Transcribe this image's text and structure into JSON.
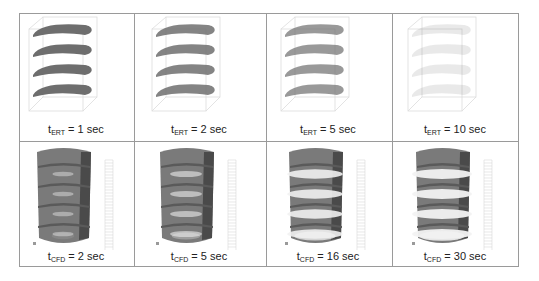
{
  "figure": {
    "rows": [
      {
        "row_id": "ert",
        "type": "ert-tomography",
        "cells": [
          {
            "var": "t",
            "subscript": "ERT",
            "value": "= 1 sec",
            "intensity": 1.0
          },
          {
            "var": "t",
            "subscript": "ERT",
            "value": "= 2 sec",
            "intensity": 0.85
          },
          {
            "var": "t",
            "subscript": "ERT",
            "value": "= 5 sec",
            "intensity": 0.7
          },
          {
            "var": "t",
            "subscript": "ERT",
            "value": "= 10 sec",
            "intensity": 0.15
          }
        ]
      },
      {
        "row_id": "cfd",
        "type": "cfd-simulation",
        "cells": [
          {
            "var": "t",
            "subscript": "CFD",
            "value": "= 2 sec",
            "white": 0.1
          },
          {
            "var": "t",
            "subscript": "CFD",
            "value": "= 5 sec",
            "white": 0.3
          },
          {
            "var": "t",
            "subscript": "CFD",
            "value": "= 16 sec",
            "white": 0.75
          },
          {
            "var": "t",
            "subscript": "CFD",
            "value": "= 30 sec",
            "white": 0.9
          }
        ]
      }
    ],
    "colors": {
      "border": "#9a9a9a",
      "ert_blob": "#6e6e6e",
      "cfd_body": "#7a7a7a",
      "cfd_dark": "#4a4a4a",
      "cfd_light": "#f2f2f2"
    }
  }
}
